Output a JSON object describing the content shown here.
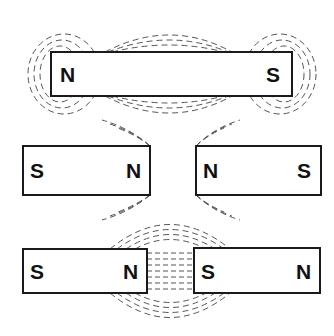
{
  "diagram": {
    "magnets": [
      {
        "id": "top",
        "left_pole": "N",
        "right_pole": "S"
      },
      {
        "id": "middle-left",
        "left_pole": "S",
        "right_pole": "N"
      },
      {
        "id": "middle-right",
        "left_pole": "N",
        "right_pole": "S"
      },
      {
        "id": "bottom-left",
        "left_pole": "S",
        "right_pole": "N"
      },
      {
        "id": "bottom-right",
        "left_pole": "S",
        "right_pole": "N"
      }
    ],
    "colors": {
      "outline": "#1a1a1a",
      "field_lines": "#555555",
      "background": "#ffffff"
    }
  }
}
